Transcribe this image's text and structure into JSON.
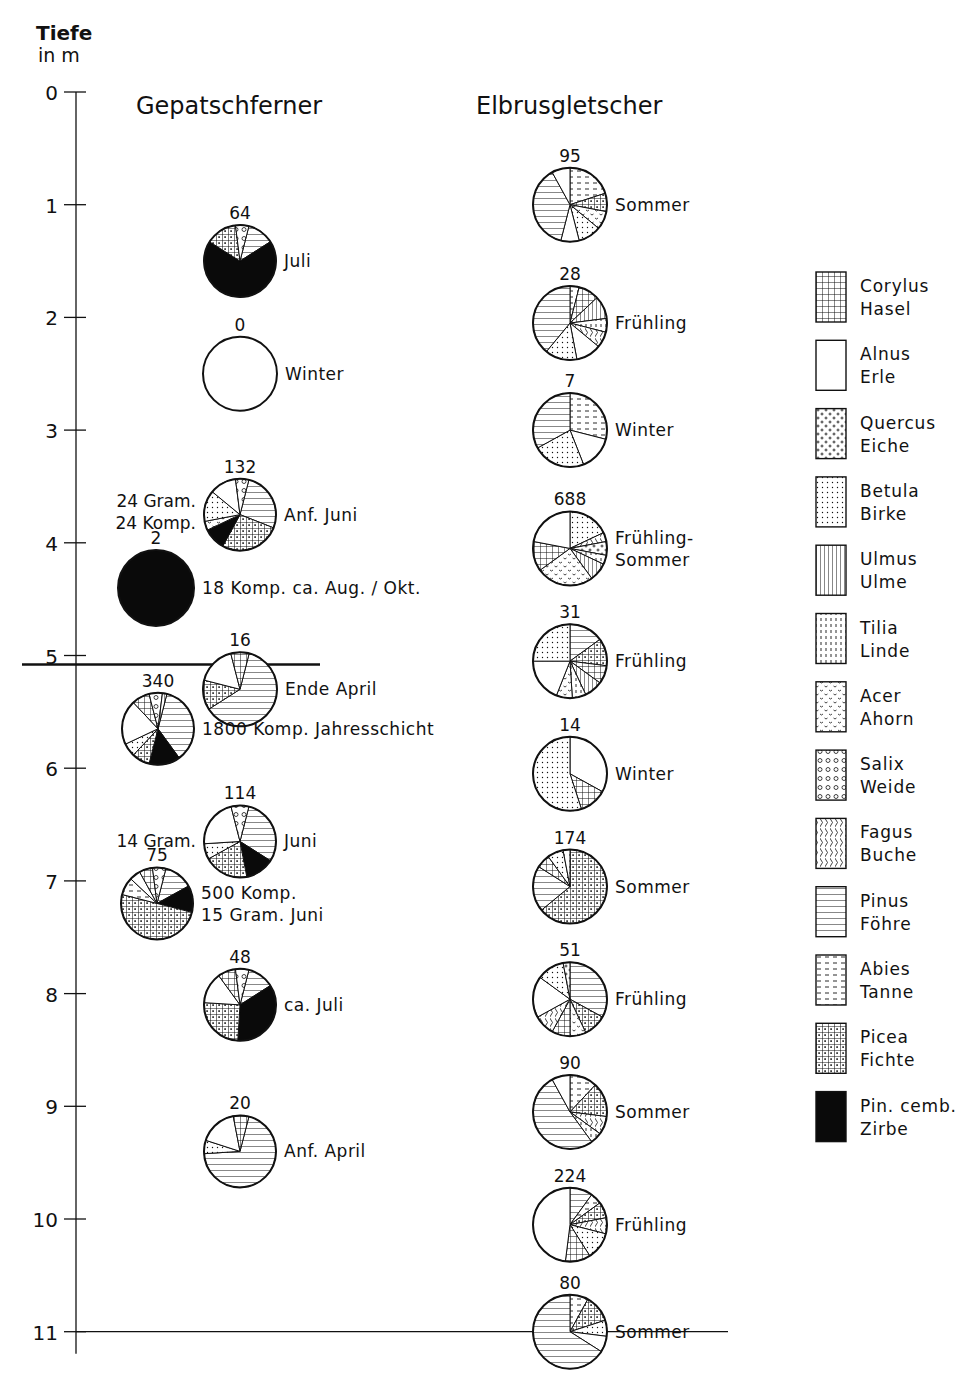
{
  "axis": {
    "title_line1": "Tiefe",
    "title_line2": "in m",
    "ticks": [
      0,
      1,
      2,
      3,
      4,
      5,
      6,
      7,
      8,
      9,
      10,
      11
    ]
  },
  "columns": {
    "left_title": "Gepatschferner",
    "right_title": "Elbrusgletscher"
  },
  "legend": [
    {
      "key": "corylus",
      "latin": "Corylus",
      "german": "Hasel"
    },
    {
      "key": "alnus",
      "latin": "Alnus",
      "german": "Erle"
    },
    {
      "key": "quercus",
      "latin": "Quercus",
      "german": "Eiche"
    },
    {
      "key": "betula",
      "latin": "Betula",
      "german": "Birke"
    },
    {
      "key": "ulmus",
      "latin": "Ulmus",
      "german": "Ulme"
    },
    {
      "key": "tilia",
      "latin": "Tilia",
      "german": "Linde"
    },
    {
      "key": "acer",
      "latin": "Acer",
      "german": "Ahorn"
    },
    {
      "key": "salix",
      "latin": "Salix",
      "german": "Weide"
    },
    {
      "key": "fagus",
      "latin": "Fagus",
      "german": "Buche"
    },
    {
      "key": "pinus",
      "latin": "Pinus",
      "german": "Föhre"
    },
    {
      "key": "abies",
      "latin": "Abies",
      "german": "Tanne"
    },
    {
      "key": "picea",
      "latin": "Picea",
      "german": "Fichte"
    },
    {
      "key": "pinus_cembra",
      "latin": "Pin. cemb.",
      "german": "Zirbe"
    }
  ],
  "chart_data": {
    "type": "pie",
    "ylabel": "Tiefe in m",
    "ylim": [
      0,
      11
    ],
    "legend_position": "right",
    "note": "Each pie is a pollen spectrum at a given depth; number above = pollen count; slice fractions estimated from the figure.",
    "series": [
      {
        "name": "Gepatschferner",
        "samples": [
          {
            "depth": 1.5,
            "cx": 240,
            "r": 36,
            "count": "64",
            "label": "Juli",
            "left_note": "",
            "slices": [
              [
                "pinus",
                0.12
              ],
              [
                "pinus_cembra",
                0.68
              ],
              [
                "picea",
                0.14
              ],
              [
                "salix",
                0.06
              ]
            ]
          },
          {
            "depth": 2.5,
            "cx": 240,
            "r": 37,
            "count": "0",
            "label": "Winter",
            "left_note": "",
            "slices": []
          },
          {
            "depth": 3.75,
            "cx": 240,
            "r": 36,
            "count": "132",
            "label": "Anf. Juni",
            "left_note": "24 Gram.|24 Komp.",
            "slices": [
              [
                "pinus",
                0.27
              ],
              [
                "picea",
                0.27
              ],
              [
                "pinus_cembra",
                0.1
              ],
              [
                "acer",
                0.04
              ],
              [
                "betula",
                0.14
              ],
              [
                "alnus",
                0.12
              ],
              [
                "salix",
                0.06
              ]
            ]
          },
          {
            "depth": 4.4,
            "cx": 156,
            "r": 38,
            "count": "2",
            "label": "18 Komp. ca. Aug. / Okt.",
            "left_note": "",
            "slices": [
              [
                "pinus_cembra",
                1.0
              ]
            ]
          },
          {
            "depth": 5.3,
            "cx": 240,
            "r": 37,
            "count": "16",
            "label": "Ende April",
            "left_note": "",
            "slices": [
              [
                "pinus",
                0.62
              ],
              [
                "picea",
                0.13
              ],
              [
                "alnus",
                0.17
              ],
              [
                "corylus",
                0.08
              ]
            ]
          },
          {
            "depth": 5.65,
            "cx": 158,
            "r": 36,
            "count": "340",
            "label": "1800 Komp. Jahresschicht",
            "left_note": "",
            "slices": [
              [
                "pinus",
                0.36
              ],
              [
                "pinus_cembra",
                0.14
              ],
              [
                "picea",
                0.08
              ],
              [
                "betula",
                0.06
              ],
              [
                "alnus",
                0.2
              ],
              [
                "corylus",
                0.08
              ],
              [
                "salix",
                0.06
              ],
              [
                "ulmus",
                0.02
              ]
            ]
          },
          {
            "depth": 6.65,
            "cx": 240,
            "r": 36,
            "count": "114",
            "label": "Juni",
            "left_note": "14 Gram.",
            "slices": [
              [
                "pinus",
                0.3
              ],
              [
                "pinus_cembra",
                0.13
              ],
              [
                "picea",
                0.2
              ],
              [
                "betula",
                0.07
              ],
              [
                "alnus",
                0.22
              ],
              [
                "salix",
                0.08
              ]
            ]
          },
          {
            "depth": 7.2,
            "cx": 157,
            "r": 36,
            "count": "75",
            "label": "500 Komp.|15 Gram.  Juni",
            "left_note": "",
            "slices": [
              [
                "pinus",
                0.13
              ],
              [
                "pinus_cembra",
                0.12
              ],
              [
                "picea",
                0.5
              ],
              [
                "abies",
                0.08
              ],
              [
                "alnus",
                0.05
              ],
              [
                "corylus",
                0.06
              ],
              [
                "salix",
                0.06
              ]
            ]
          },
          {
            "depth": 8.1,
            "cx": 240,
            "r": 36,
            "count": "48",
            "label": "ca. Juli",
            "left_note": "",
            "slices": [
              [
                "pinus",
                0.12
              ],
              [
                "pinus_cembra",
                0.35
              ],
              [
                "picea",
                0.25
              ],
              [
                "alnus",
                0.14
              ],
              [
                "corylus",
                0.08
              ],
              [
                "salix",
                0.06
              ]
            ]
          },
          {
            "depth": 9.4,
            "cx": 240,
            "r": 36,
            "count": "20",
            "label": "Anf. April",
            "left_note": "",
            "slices": [
              [
                "pinus",
                0.7
              ],
              [
                "betula",
                0.06
              ],
              [
                "alnus",
                0.17
              ],
              [
                "corylus",
                0.07
              ]
            ]
          }
        ]
      },
      {
        "name": "Elbrusgletscher",
        "samples": [
          {
            "depth": 1.0,
            "cx": 570,
            "r": 37,
            "count": "95",
            "label": "Sommer",
            "slices": [
              [
                "abies",
                0.2
              ],
              [
                "picea",
                0.08
              ],
              [
                "acer",
                0.08
              ],
              [
                "betula",
                0.1
              ],
              [
                "alnus",
                0.08
              ],
              [
                "pinus",
                0.38
              ],
              [
                "pinus_cembra",
                0.0
              ],
              [
                "alnus",
                0.08
              ]
            ]
          },
          {
            "depth": 2.05,
            "cx": 570,
            "r": 37,
            "count": "28",
            "label": "Frühling",
            "slices": [
              [
                "abies",
                0.04
              ],
              [
                "corylus",
                0.09
              ],
              [
                "ulmus",
                0.1
              ],
              [
                "tilia",
                0.06
              ],
              [
                "fagus",
                0.07
              ],
              [
                "alnus",
                0.11
              ],
              [
                "betula",
                0.14
              ],
              [
                "pinus",
                0.39
              ]
            ]
          },
          {
            "depth": 3.0,
            "cx": 570,
            "r": 37,
            "count": "7",
            "label": "Winter",
            "slices": [
              [
                "abies",
                0.29
              ],
              [
                "alnus",
                0.15
              ],
              [
                "betula",
                0.23
              ],
              [
                "pinus",
                0.33
              ]
            ]
          },
          {
            "depth": 4.05,
            "cx": 570,
            "r": 37,
            "count": "688",
            "label": "Frühling-|Sommer",
            "slices": [
              [
                "betula",
                0.18
              ],
              [
                "fagus",
                0.04
              ],
              [
                "quercus",
                0.06
              ],
              [
                "tilia",
                0.04
              ],
              [
                "ulmus",
                0.08
              ],
              [
                "acer",
                0.25
              ],
              [
                "corylus",
                0.13
              ],
              [
                "alnus",
                0.22
              ]
            ]
          },
          {
            "depth": 5.05,
            "cx": 570,
            "r": 37,
            "count": "31",
            "label": "Frühling",
            "slices": [
              [
                "pinus",
                0.15
              ],
              [
                "picea",
                0.12
              ],
              [
                "corylus",
                0.08
              ],
              [
                "ulmus",
                0.08
              ],
              [
                "tilia",
                0.06
              ],
              [
                "acer",
                0.07
              ],
              [
                "alnus",
                0.19
              ],
              [
                "betula",
                0.25
              ]
            ]
          },
          {
            "depth": 6.05,
            "cx": 570,
            "r": 37,
            "count": "14",
            "label": "Winter",
            "slices": [
              [
                "alnus",
                0.33
              ],
              [
                "corylus",
                0.12
              ],
              [
                "betula",
                0.55
              ]
            ]
          },
          {
            "depth": 7.05,
            "cx": 570,
            "r": 37,
            "count": "174",
            "label": "Sommer",
            "slices": [
              [
                "picea",
                0.64
              ],
              [
                "pinus",
                0.2
              ],
              [
                "corylus",
                0.06
              ],
              [
                "betula",
                0.07
              ],
              [
                "abies",
                0.03
              ]
            ]
          },
          {
            "depth": 8.05,
            "cx": 570,
            "r": 37,
            "count": "51",
            "label": "Frühling",
            "slices": [
              [
                "pinus",
                0.33
              ],
              [
                "picea",
                0.1
              ],
              [
                "acer",
                0.07
              ],
              [
                "corylus",
                0.08
              ],
              [
                "fagus",
                0.09
              ],
              [
                "alnus",
                0.18
              ],
              [
                "betula",
                0.12
              ],
              [
                "quercus",
                0.03
              ]
            ]
          },
          {
            "depth": 9.05,
            "cx": 570,
            "r": 37,
            "count": "90",
            "label": "Sommer",
            "slices": [
              [
                "abies",
                0.12
              ],
              [
                "picea",
                0.15
              ],
              [
                "fagus",
                0.08
              ],
              [
                "tilia",
                0.05
              ],
              [
                "pinus",
                0.52
              ],
              [
                "alnus",
                0.08
              ]
            ]
          },
          {
            "depth": 10.05,
            "cx": 570,
            "r": 37,
            "count": "224",
            "label": "Frühling",
            "slices": [
              [
                "pinus",
                0.1
              ],
              [
                "abies",
                0.05
              ],
              [
                "picea",
                0.07
              ],
              [
                "fagus",
                0.07
              ],
              [
                "betula",
                0.12
              ],
              [
                "corylus",
                0.11
              ],
              [
                "alnus",
                0.48
              ]
            ]
          },
          {
            "depth": 11.0,
            "cx": 570,
            "r": 37,
            "count": "80",
            "label": "Sommer",
            "slices": [
              [
                "abies",
                0.08
              ],
              [
                "picea",
                0.12
              ],
              [
                "betula",
                0.07
              ],
              [
                "alnus",
                0.07
              ],
              [
                "pinus",
                0.66
              ]
            ]
          }
        ]
      }
    ]
  },
  "reference_lines": [
    {
      "depth": 5.08,
      "x1": 22,
      "x2": 320,
      "thick": true
    },
    {
      "depth": 11.0,
      "x1": 76,
      "x2": 728,
      "thick": false
    }
  ]
}
